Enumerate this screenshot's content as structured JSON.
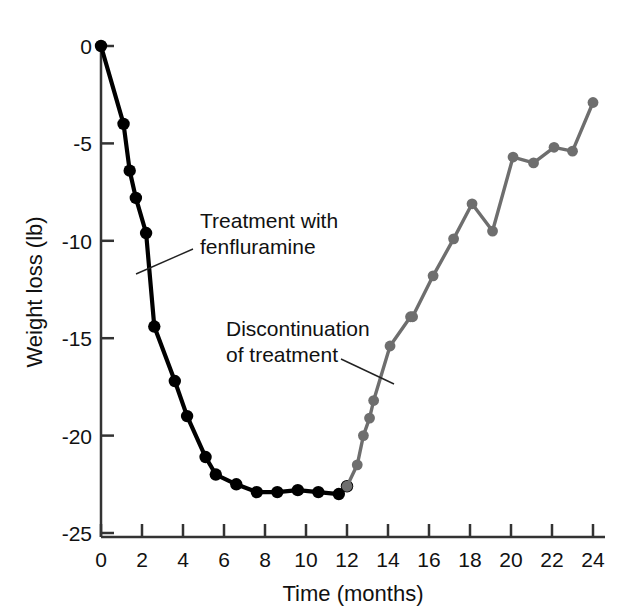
{
  "chart_data": {
    "type": "line",
    "title": "",
    "xlabel": "Time (months)",
    "ylabel": "Weight loss (lb)",
    "xlim": [
      0,
      24
    ],
    "ylim": [
      -25,
      0
    ],
    "xticks": [
      0,
      2,
      4,
      6,
      8,
      10,
      12,
      14,
      16,
      18,
      20,
      22,
      24
    ],
    "xtick_labels": [
      "0",
      "2",
      "4",
      "6",
      "8",
      "10",
      "12",
      "14",
      "16",
      "18",
      "20",
      "22",
      "24"
    ],
    "yticks": [
      0,
      -5,
      -10,
      -15,
      -20,
      -25
    ],
    "ytick_labels": [
      "0",
      "-5",
      "-10",
      "-15",
      "-20",
      "-25"
    ],
    "grid": false,
    "legend": null,
    "series": [
      {
        "name": "Treatment with fenfluramine",
        "color": "#000000",
        "marker": "filled-circle",
        "x": [
          0.0,
          1.1,
          1.4,
          1.7,
          2.2,
          2.6,
          3.6,
          4.2,
          5.1,
          5.6,
          6.6,
          7.6,
          8.6,
          9.6,
          10.6,
          11.6,
          12.0
        ],
        "y": [
          0.0,
          -4.0,
          -6.4,
          -7.8,
          -9.6,
          -14.4,
          -17.2,
          -19.0,
          -21.1,
          -22.0,
          -22.5,
          -22.9,
          -22.9,
          -22.8,
          -22.9,
          -23.0,
          -22.6
        ]
      },
      {
        "name": "Discontinuation of treatment",
        "color": "#6e6e6e",
        "marker": "filled-circle",
        "x": [
          12.0,
          12.5,
          12.8,
          13.1,
          13.3,
          14.1,
          15.1,
          15.2,
          16.2,
          17.2,
          18.1,
          19.1,
          20.1,
          21.1,
          22.1,
          23.0,
          24.0
        ],
        "y": [
          -22.6,
          -21.5,
          -20.0,
          -19.1,
          -18.2,
          -15.4,
          -13.9,
          -13.9,
          -11.8,
          -9.9,
          -8.1,
          -9.5,
          -5.7,
          -6.0,
          -5.2,
          -5.4,
          -2.9
        ]
      }
    ],
    "annotations": [
      {
        "id": "treatment-annotation",
        "lines": [
          "Treatment with",
          "fenfluramine"
        ],
        "text_x": 200,
        "text_y": 228,
        "leader": {
          "x1": 193,
          "y1": 249,
          "x2": 136,
          "y2": 274
        }
      },
      {
        "id": "discontinuation-annotation",
        "lines": [
          "Discontinuation",
          "of treatment"
        ],
        "text_x": 226,
        "text_y": 336,
        "leader": {
          "x1": 341,
          "y1": 359,
          "x2": 394,
          "y2": 384
        }
      }
    ]
  },
  "axes": {
    "ylabel": "Weight loss (lb)",
    "xlabel": "Time (months)"
  }
}
